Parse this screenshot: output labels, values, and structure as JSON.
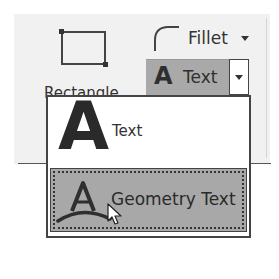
{
  "ribbon": {
    "rectangle": {
      "label": "Rectangle",
      "icon": "rectangle-icon"
    },
    "fillet": {
      "label": "Fillet",
      "icon": "fillet-icon",
      "dropdown_icon": "chevron-down-icon"
    },
    "text_split": {
      "label": "Text",
      "glyph": "A",
      "icon": "text-icon",
      "dropdown_icon": "chevron-down-icon",
      "state": "pressed"
    }
  },
  "dropdown_menu": {
    "items": [
      {
        "label": "Text",
        "glyph": "A",
        "icon": "text-icon",
        "highlighted": false
      },
      {
        "label": "Geometry Text",
        "glyph": "A",
        "icon": "geometry-text-icon",
        "highlighted": true
      }
    ]
  },
  "colors": {
    "panel_bg": "#f1f1f1",
    "pressed_bg": "#a9a9a9",
    "menu_bg": "#ffffff",
    "border": "#444444"
  }
}
